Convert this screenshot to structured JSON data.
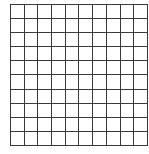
{
  "grid": {
    "rows": 10,
    "cols": 10,
    "cell_width": 13.7,
    "cell_height": 14.1,
    "line_color": "#3a3a3a",
    "fill_color": "#ffffff",
    "shaded_cells": []
  }
}
